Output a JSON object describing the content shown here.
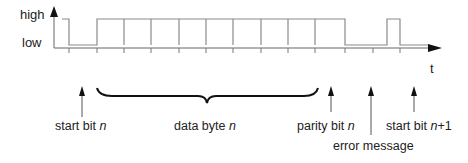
{
  "diagram": {
    "y_axis": {
      "high_label": "high",
      "low_label": "low"
    },
    "x_axis": {
      "label": "t"
    },
    "signal": {
      "segments": [
        {
          "name": "idle",
          "level": "high"
        },
        {
          "name": "start bit n",
          "level": "low"
        },
        {
          "name": "data bit 0",
          "level": "high"
        },
        {
          "name": "data bit 1",
          "level": "high"
        },
        {
          "name": "data bit 2",
          "level": "high"
        },
        {
          "name": "data bit 3",
          "level": "high"
        },
        {
          "name": "data bit 4",
          "level": "high"
        },
        {
          "name": "data bit 5",
          "level": "high"
        },
        {
          "name": "data bit 6",
          "level": "high"
        },
        {
          "name": "data bit 7",
          "level": "high"
        },
        {
          "name": "parity bit n",
          "level": "high"
        },
        {
          "name": "error message",
          "level": "low"
        },
        {
          "name": "start bit n+1 (high pulse)",
          "level": "high"
        },
        {
          "name": "idle after",
          "level": "low"
        }
      ]
    },
    "labels": {
      "start_bit": {
        "text": "start bit ",
        "var": "n"
      },
      "data_byte": {
        "text": "data byte ",
        "var": "n"
      },
      "parity_bit": {
        "text": "parity bit ",
        "var": "n"
      },
      "error_message": {
        "text": "error message"
      },
      "start_bit_next": {
        "text": "start bit ",
        "var": "n",
        "suffix": "+1"
      }
    },
    "colors": {
      "line": "#8a8a8a",
      "axis": "#555555",
      "text": "#222222",
      "arrow": "#111111"
    }
  }
}
